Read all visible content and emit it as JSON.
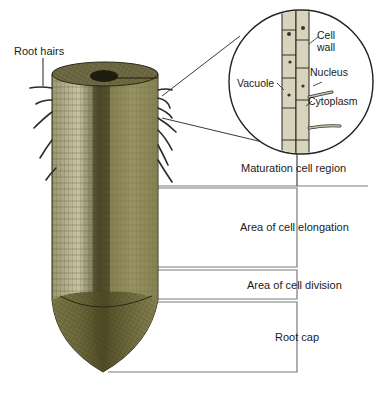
{
  "diagram": {
    "labels": {
      "root_hairs": "Root hairs",
      "cell_wall_line1": "Cell",
      "cell_wall_line2": "wall",
      "nucleus": "Nucleus",
      "vacuole": "Vacuole",
      "cytoplasm": "Cytoplasm",
      "maturation": "Maturation cell region",
      "elongation": "Area of cell elongation",
      "division": "Area of cell division",
      "root_cap": "Root cap"
    },
    "colors": {
      "root_light": "#c9c6a4",
      "root_mid": "#8f8a5c",
      "root_dark": "#4a4628",
      "root_cap": "#6b6632",
      "cell_fill": "#d8d4bc",
      "line": "#222222",
      "bracket": "#7a7a7a"
    }
  }
}
